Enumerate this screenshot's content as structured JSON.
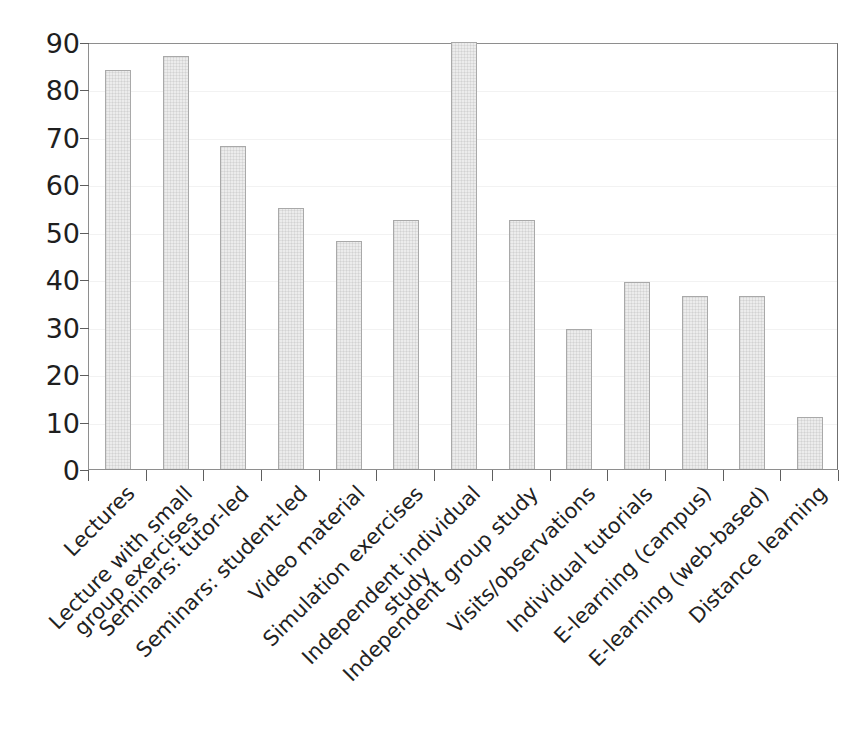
{
  "chart_data": {
    "type": "bar",
    "title": "",
    "xlabel": "",
    "ylabel": "",
    "ylim": [
      0,
      90
    ],
    "ytick_step": 10,
    "yticks": [
      "90",
      "80",
      "70",
      "60",
      "50",
      "40",
      "30",
      "20",
      "10",
      "0"
    ],
    "grid": true,
    "legend": null,
    "categories": [
      "Lectures",
      "Lecture with small group exercises",
      "Seminars: tutor-led",
      "Seminars: student-led",
      "Video material",
      "Simulation exercises",
      "Independent individual study",
      "Independent group study",
      "Visits/observations",
      "Individual tutorials",
      "E-learning (campus)",
      "E-learning (web-based)",
      "Distance learning"
    ],
    "category_lines": [
      [
        "Lectures"
      ],
      [
        "Lecture with small",
        "group exercises"
      ],
      [
        "Seminars: tutor-led"
      ],
      [
        "Seminars: student-led"
      ],
      [
        "Video material"
      ],
      [
        "Simulation exercises"
      ],
      [
        "Independent individual",
        "study"
      ],
      [
        "Independent group study"
      ],
      [
        "Visits/observations"
      ],
      [
        "Individual tutorials"
      ],
      [
        "E-learning (campus)"
      ],
      [
        "E-learning (web-based)"
      ],
      [
        "Distance learning"
      ]
    ],
    "values": [
      84,
      87,
      68,
      55,
      48,
      52.5,
      90,
      52.5,
      29.5,
      39.5,
      36.5,
      36.5,
      11
    ]
  },
  "style": {
    "bar_fill": "#ececec",
    "bar_border": "#a9a9a9",
    "axis_color": "#5e5e5e",
    "frame_color": "#8e8e8e",
    "text_color": "#1f1f1f",
    "background": "#ffffff"
  }
}
